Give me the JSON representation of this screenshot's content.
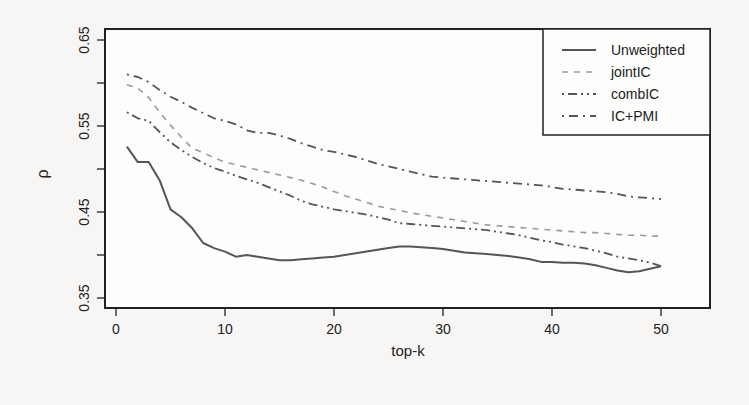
{
  "chart_data": {
    "type": "line",
    "title": "",
    "xlabel": "top-k",
    "ylabel": "ρ",
    "xlim": [
      0,
      52
    ],
    "ylim": [
      0.35,
      0.65
    ],
    "xticks": [
      0,
      10,
      20,
      30,
      40,
      50
    ],
    "yticks": [
      0.35,
      0.45,
      0.55,
      0.65
    ],
    "yticks_minor": [
      0.4,
      0.5,
      0.6
    ],
    "grid": false,
    "legend_position": "top-right",
    "x": [
      1,
      2,
      3,
      4,
      5,
      6,
      7,
      8,
      9,
      10,
      11,
      12,
      13,
      14,
      15,
      16,
      17,
      18,
      19,
      20,
      21,
      22,
      23,
      24,
      25,
      26,
      27,
      28,
      29,
      30,
      31,
      32,
      33,
      34,
      35,
      36,
      37,
      38,
      39,
      40,
      41,
      42,
      43,
      44,
      45,
      46,
      47,
      48,
      49,
      50
    ],
    "series": [
      {
        "name": "Unweighted",
        "linestyle": "solid",
        "values": [
          0.526,
          0.508,
          0.508,
          0.487,
          0.453,
          0.444,
          0.431,
          0.414,
          0.408,
          0.404,
          0.398,
          0.4,
          0.398,
          0.396,
          0.394,
          0.394,
          0.395,
          0.396,
          0.397,
          0.398,
          0.4,
          0.402,
          0.404,
          0.406,
          0.408,
          0.41,
          0.41,
          0.409,
          0.408,
          0.407,
          0.405,
          0.403,
          0.402,
          0.401,
          0.4,
          0.399,
          0.397,
          0.395,
          0.392,
          0.392,
          0.391,
          0.391,
          0.39,
          0.388,
          0.385,
          0.382,
          0.38,
          0.381,
          0.384,
          0.387
        ]
      },
      {
        "name": "jointIC",
        "linestyle": "dashed",
        "values": [
          0.598,
          0.594,
          0.583,
          0.566,
          0.551,
          0.537,
          0.524,
          0.519,
          0.513,
          0.508,
          0.505,
          0.502,
          0.499,
          0.496,
          0.493,
          0.49,
          0.487,
          0.483,
          0.479,
          0.474,
          0.469,
          0.465,
          0.461,
          0.457,
          0.454,
          0.452,
          0.449,
          0.447,
          0.445,
          0.443,
          0.441,
          0.439,
          0.437,
          0.435,
          0.434,
          0.433,
          0.432,
          0.431,
          0.43,
          0.429,
          0.428,
          0.427,
          0.426,
          0.426,
          0.425,
          0.424,
          0.423,
          0.423,
          0.422,
          0.422
        ]
      },
      {
        "name": "combIC",
        "linestyle": "dashdotdot",
        "values": [
          0.566,
          0.559,
          0.556,
          0.543,
          0.531,
          0.522,
          0.514,
          0.507,
          0.501,
          0.497,
          0.492,
          0.488,
          0.484,
          0.479,
          0.474,
          0.469,
          0.463,
          0.459,
          0.456,
          0.453,
          0.451,
          0.449,
          0.447,
          0.444,
          0.441,
          0.437,
          0.436,
          0.435,
          0.434,
          0.433,
          0.432,
          0.431,
          0.43,
          0.429,
          0.427,
          0.425,
          0.423,
          0.42,
          0.417,
          0.415,
          0.412,
          0.41,
          0.408,
          0.405,
          0.402,
          0.398,
          0.396,
          0.394,
          0.391,
          0.387
        ]
      },
      {
        "name": "IC+PMI",
        "linestyle": "dashdot",
        "values": [
          0.61,
          0.607,
          0.601,
          0.592,
          0.584,
          0.578,
          0.571,
          0.565,
          0.559,
          0.556,
          0.552,
          0.545,
          0.542,
          0.542,
          0.539,
          0.535,
          0.53,
          0.526,
          0.522,
          0.52,
          0.517,
          0.514,
          0.51,
          0.506,
          0.503,
          0.5,
          0.497,
          0.494,
          0.491,
          0.49,
          0.489,
          0.488,
          0.487,
          0.486,
          0.485,
          0.484,
          0.483,
          0.482,
          0.481,
          0.479,
          0.477,
          0.476,
          0.475,
          0.474,
          0.473,
          0.471,
          0.468,
          0.467,
          0.466,
          0.465
        ]
      }
    ]
  },
  "legend": {
    "items": [
      {
        "label": "Unweighted",
        "dash": "none"
      },
      {
        "label": "jointIC",
        "dash": "6,6"
      },
      {
        "label": "combIC",
        "dash": "2,4,9,4,2,4"
      },
      {
        "label": "IC+PMI",
        "dash": "2,5,9,5"
      }
    ]
  },
  "axes": {
    "xlabel": "top-k",
    "ylabel": "ρ",
    "xtick_labels": [
      "0",
      "10",
      "20",
      "30",
      "40",
      "50"
    ],
    "ytick_labels": [
      "0.35",
      "0.45",
      "0.55",
      "0.65"
    ]
  },
  "colors": {
    "axis": "#222222",
    "unweighted": "#555555",
    "jointIC": "#9a9a9a",
    "combIC": "#555555",
    "icpmi": "#555555"
  }
}
